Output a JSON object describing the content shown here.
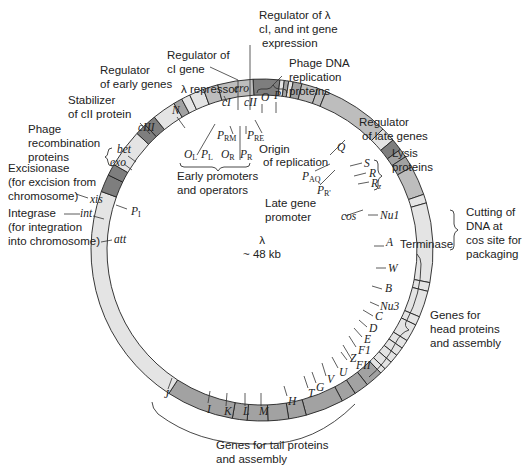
{
  "center": {
    "symbol": "λ",
    "size": "~ 48 kb"
  },
  "colors": {
    "light": "#e4e4e4",
    "medium": "#bdbdbd",
    "mid_dark": "#a2a2a2",
    "dark": "#7e7e7e",
    "outline": "#222222",
    "text": "#222222"
  },
  "segments": [
    {
      "from": -3,
      "to": 6,
      "shade": "dark"
    },
    {
      "from": 6,
      "to": 7.5,
      "shade": "light"
    },
    {
      "from": 7.5,
      "to": 9,
      "shade": "mid_dark"
    },
    {
      "from": 9,
      "to": 10.5,
      "shade": "light"
    },
    {
      "from": 10.5,
      "to": 13.5,
      "shade": "mid_dark"
    },
    {
      "from": 13.5,
      "to": 19,
      "shade": "medium"
    },
    {
      "from": 19,
      "to": 22,
      "shade": "medium"
    },
    {
      "from": 22,
      "to": 45,
      "shade": "medium"
    },
    {
      "from": 45,
      "to": 50,
      "shade": "light"
    },
    {
      "from": 50,
      "to": 54,
      "shade": "dark"
    },
    {
      "from": 54,
      "to": 57,
      "shade": "mid_dark"
    },
    {
      "from": 57,
      "to": 61,
      "shade": "mid_dark"
    },
    {
      "from": 61,
      "to": 71,
      "shade": "medium"
    },
    {
      "from": 71,
      "to": 74,
      "shade": "light"
    },
    {
      "from": 74,
      "to": 101,
      "shade": "light"
    },
    {
      "from": 101,
      "to": 104,
      "shade": "light"
    },
    {
      "from": 104,
      "to": 113,
      "shade": "light"
    },
    {
      "from": 113,
      "to": 116,
      "shade": "light"
    },
    {
      "from": 116,
      "to": 122,
      "shade": "light"
    },
    {
      "from": 122,
      "to": 125,
      "shade": "light"
    },
    {
      "from": 125,
      "to": 128,
      "shade": "light"
    },
    {
      "from": 128,
      "to": 131,
      "shade": "light"
    },
    {
      "from": 131,
      "to": 134,
      "shade": "light"
    },
    {
      "from": 134,
      "to": 136,
      "shade": "light"
    },
    {
      "from": 136,
      "to": 142,
      "shade": "mid_dark"
    },
    {
      "from": 142,
      "to": 147,
      "shade": "mid_dark"
    },
    {
      "from": 147,
      "to": 152,
      "shade": "mid_dark"
    },
    {
      "from": 152,
      "to": 165,
      "shade": "mid_dark"
    },
    {
      "from": 165,
      "to": 171,
      "shade": "mid_dark"
    },
    {
      "from": 171,
      "to": 178,
      "shade": "mid_dark"
    },
    {
      "from": 178,
      "to": 185,
      "shade": "mid_dark"
    },
    {
      "from": 185,
      "to": 190,
      "shade": "mid_dark"
    },
    {
      "from": 190,
      "to": 213,
      "shade": "mid_dark"
    },
    {
      "from": 213,
      "to": 290,
      "shade": "light"
    },
    {
      "from": 290,
      "to": 296,
      "shade": "dark"
    },
    {
      "from": 296,
      "to": 300,
      "shade": "dark"
    },
    {
      "from": 300,
      "to": 313,
      "shade": "light"
    },
    {
      "from": 313,
      "to": 317,
      "shade": "dark"
    },
    {
      "from": 317,
      "to": 321,
      "shade": "dark"
    },
    {
      "from": 321,
      "to": 329,
      "shade": "light"
    },
    {
      "from": 329,
      "to": 332,
      "shade": "mid_dark"
    },
    {
      "from": 332,
      "to": 335,
      "shade": "light"
    },
    {
      "from": 335,
      "to": 340,
      "shade": "light"
    },
    {
      "from": 340,
      "to": 345,
      "shade": "medium"
    },
    {
      "from": 345,
      "to": 357,
      "shade": "medium"
    }
  ],
  "gene_labels": [
    {
      "name": "N",
      "x": 172,
      "y": 114
    },
    {
      "name": "cIII",
      "x": 138,
      "y": 131
    },
    {
      "name": "bet",
      "x": 117,
      "y": 153
    },
    {
      "name": "exo",
      "x": 110,
      "y": 166
    },
    {
      "name": "xis",
      "x": 90,
      "y": 203
    },
    {
      "name": "int",
      "x": 80,
      "y": 217
    },
    {
      "name": "att",
      "x": 114,
      "y": 243
    },
    {
      "name": "cI",
      "x": 222,
      "y": 106
    },
    {
      "name": "cro",
      "x": 234,
      "y": 92
    },
    {
      "name": "cII",
      "x": 244,
      "y": 106
    },
    {
      "name": "O",
      "x": 261,
      "y": 101
    },
    {
      "name": "P",
      "x": 274,
      "y": 99
    },
    {
      "name": "Q",
      "x": 337,
      "y": 151
    },
    {
      "name": "S",
      "x": 364,
      "y": 167
    },
    {
      "name": "R",
      "x": 369,
      "y": 177
    },
    {
      "name": "Rz",
      "x": 371,
      "y": 187
    },
    {
      "name": "cos",
      "x": 341,
      "y": 220
    },
    {
      "name": "Nu1",
      "x": 380,
      "y": 219
    },
    {
      "name": "A",
      "x": 386,
      "y": 246
    },
    {
      "name": "W",
      "x": 388,
      "y": 272
    },
    {
      "name": "B",
      "x": 385,
      "y": 292
    },
    {
      "name": "Nu3",
      "x": 380,
      "y": 310
    },
    {
      "name": "C",
      "x": 375,
      "y": 320
    },
    {
      "name": "D",
      "x": 369,
      "y": 332
    },
    {
      "name": "E",
      "x": 364,
      "y": 343
    },
    {
      "name": "F1",
      "x": 358,
      "y": 354
    },
    {
      "name": "FII",
      "x": 356,
      "y": 369
    },
    {
      "name": "Z",
      "x": 350,
      "y": 362
    },
    {
      "name": "U",
      "x": 339,
      "y": 376
    },
    {
      "name": "V",
      "x": 327,
      "y": 383
    },
    {
      "name": "G",
      "x": 316,
      "y": 391
    },
    {
      "name": "T",
      "x": 308,
      "y": 397
    },
    {
      "name": "H",
      "x": 288,
      "y": 405
    },
    {
      "name": "M",
      "x": 259,
      "y": 415
    },
    {
      "name": "L",
      "x": 243,
      "y": 415
    },
    {
      "name": "K",
      "x": 224,
      "y": 415
    },
    {
      "name": "I",
      "x": 207,
      "y": 413
    },
    {
      "name": "J",
      "x": 164,
      "y": 398
    }
  ],
  "annotations": {
    "regulator_cI_int": [
      "Regulator of λ",
      "cI, and int gene",
      "expression"
    ],
    "regulator_cI_gene": [
      "Regulator of",
      "cI gene"
    ],
    "regulator_early": [
      "Regulator",
      "of early genes"
    ],
    "lambda_repressor": "λ repressor",
    "stabilizer": [
      "Stabilizer",
      "of cII protein"
    ],
    "phage_recombination": [
      "Phage",
      "recombination",
      "proteins"
    ],
    "excisionase": [
      "Excisionase",
      "(for excision from",
      "chromosome)"
    ],
    "integrase": [
      "Integrase",
      "(for integration",
      "into chromosome)"
    ],
    "phage_dna_replication": [
      "Phage DNA",
      "replication",
      "proteins"
    ],
    "regulator_late": [
      "Regulator",
      "of late genes"
    ],
    "lysis": [
      "Lysis",
      "proteins"
    ],
    "late_gene_promoter": [
      "Late gene",
      "promoter"
    ],
    "origin": [
      "Origin",
      "of replication"
    ],
    "early_promoters": [
      "Early promoters",
      "and operators"
    ],
    "cutting": [
      "Cutting of",
      "DNA at",
      "cos site for",
      "packaging"
    ],
    "terminase": "Terminase",
    "head_genes": [
      "Genes for",
      "head proteins",
      "and assembly"
    ],
    "tail_genes": [
      "Genes for tail proteins",
      "and assembly"
    ]
  },
  "promoters": {
    "PRM": {
      "main": "P",
      "sub": "RM"
    },
    "PRE": {
      "main": "P",
      "sub": "RE"
    },
    "OL": {
      "main": "O",
      "sub": "L"
    },
    "PL": {
      "main": "P",
      "sub": "L"
    },
    "OR": {
      "main": "O",
      "sub": "R"
    },
    "PR": {
      "main": "P",
      "sub": "R"
    },
    "PAQ": {
      "main": "P",
      "sub": "AQ"
    },
    "PR2": {
      "main": "P",
      "sub": "R'"
    },
    "PI": {
      "main": "P",
      "sub": "I"
    }
  }
}
